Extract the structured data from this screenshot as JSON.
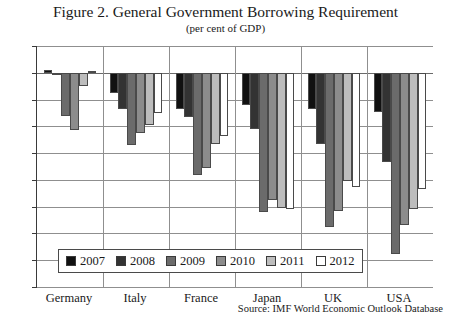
{
  "figure": {
    "title": "Figure 2. General Government Borrowing Requirement",
    "subtitle": "(per cent of GDP)",
    "source": "Source: IMF World Economic Outlook Database"
  },
  "chart_data": {
    "type": "bar",
    "title": "Figure 2. General Government Borrowing Requirement",
    "subtitle": "(per cent of GDP)",
    "xlabel": "",
    "ylabel": "",
    "ylim": [
      -16,
      2
    ],
    "ytick_step": 2,
    "yticks": [
      2,
      0,
      -2,
      -4,
      -6,
      -8,
      -10,
      -12,
      -14,
      -16
    ],
    "grid": true,
    "legend_position": "bottom-inside",
    "categories": [
      "Germany",
      "Italy",
      "France",
      "Japan",
      "UK",
      "USA"
    ],
    "series": [
      {
        "name": "2007",
        "color": "#111111",
        "values": [
          0.2,
          -1.5,
          -2.7,
          -2.4,
          -2.7,
          -2.9
        ]
      },
      {
        "name": "2008",
        "color": "#333333",
        "values": [
          -0.1,
          -2.7,
          -3.3,
          -4.2,
          -5.3,
          -6.7
        ]
      },
      {
        "name": "2009",
        "color": "#6b6b6b",
        "values": [
          -3.2,
          -5.4,
          -7.6,
          -10.4,
          -11.5,
          -13.5
        ]
      },
      {
        "name": "2010",
        "color": "#8c8c8c",
        "values": [
          -4.3,
          -4.5,
          -7.1,
          -9.5,
          -10.3,
          -11.4
        ]
      },
      {
        "name": "2011",
        "color": "#bdbdbd",
        "values": [
          -1.0,
          -3.9,
          -5.3,
          -10.1,
          -8.1,
          -10.2
        ]
      },
      {
        "name": "2012",
        "color": "#ffffff",
        "values": [
          0.1,
          -3.0,
          -4.7,
          -10.2,
          -8.5,
          -8.7
        ]
      }
    ]
  }
}
